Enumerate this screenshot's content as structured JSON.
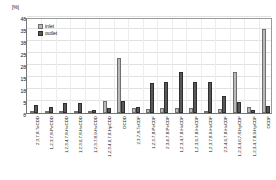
{
  "chart_data": {
    "type": "bar",
    "title": "",
    "xlabel": "",
    "ylabel": "[%]",
    "yunit": "[%]",
    "ylim": [
      0,
      40
    ],
    "yticks": [
      0,
      5,
      10,
      15,
      20,
      25,
      30,
      35,
      40
    ],
    "grid": true,
    "legend_position": "top-left",
    "categories": [
      "2,3,7,8-TeCDD",
      "1,2,3,7,8-PeCDD",
      "1,2,3,4,7,8-HxCDD",
      "1,2,3,6,7,8-HxCDD",
      "1,2,3,7,8,9-HxCDD",
      "1,2,3,4,6,7,8-HpCDD",
      "OCDD",
      "2,3,7,8-TeCDF",
      "1,2,3,7,8-PeCDF",
      "2,3,4,7,8-PeCDF",
      "1,2,3,4,7,8-HxCDF",
      "1,2,3,6,7,8-HxCDF",
      "1,2,3,7,8,9-HxCDF",
      "2,3,4,6,7,8-HxCDF",
      "1,2,3,4,6,7,8-HpCDF",
      "1,2,3,4,7,8,9-HpCDF",
      "OCDF"
    ],
    "series": [
      {
        "name": "inlet",
        "color": "#b9b9b9",
        "values": [
          0.3,
          0.4,
          0.6,
          0.7,
          0.4,
          5.0,
          23.0,
          2.0,
          1.5,
          2.0,
          2.2,
          2.2,
          0.6,
          1.5,
          17.0,
          2.5,
          35.0
        ]
      },
      {
        "name": "outlet",
        "color": "#585858",
        "values": [
          3.5,
          2.3,
          4.0,
          4.0,
          1.2,
          2.0,
          5.0,
          2.5,
          12.5,
          13.0,
          17.0,
          13.0,
          13.0,
          7.0,
          4.5,
          1.2,
          3.0
        ]
      }
    ],
    "legend": [
      "inlet",
      "outlet"
    ]
  }
}
